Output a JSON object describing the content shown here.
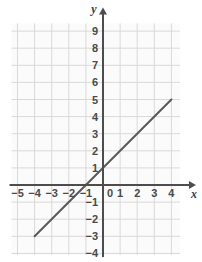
{
  "chart_data": {
    "type": "line",
    "title": "",
    "xlabel": "x",
    "ylabel": "y",
    "xlim": [
      -5.5,
      5
    ],
    "ylim": [
      -4.5,
      9.5
    ],
    "xticks": [
      -5,
      -4,
      -3,
      -2,
      -1,
      0,
      1,
      2,
      3,
      4
    ],
    "yticks": [
      -4,
      -3,
      -2,
      -1,
      0,
      1,
      2,
      3,
      4,
      5,
      6,
      7,
      8,
      9
    ],
    "xtick_labels": [
      "-5",
      "-4",
      "-3",
      "-2",
      "-1",
      "0",
      "1",
      "2",
      "3",
      "4"
    ],
    "ytick_labels": [
      "9",
      "8",
      "7",
      "6",
      "5",
      "4",
      "3",
      "2",
      "1",
      "0",
      "-1",
      "-2",
      "-3",
      "-4"
    ],
    "grid": true,
    "legend": "none",
    "series": [
      {
        "name": "line",
        "equation": "y = x + 1",
        "slope": 1,
        "intercept": 1,
        "x": [
          -4,
          4
        ],
        "values": [
          -3,
          5
        ],
        "points": [
          [
            -4,
            -3
          ],
          [
            0,
            1
          ],
          [
            4,
            5
          ]
        ],
        "x_intercept": -1,
        "y_intercept": 1,
        "color": "#595959"
      }
    ],
    "colors": {
      "line": "#595959",
      "axis": "#4d4d4d",
      "grid": "#d9d9d9",
      "grid_background": "#fbfbfb",
      "tick_text": "#4a4a4a",
      "background": "#ffffff"
    }
  },
  "axis_labels": {
    "x": "x",
    "y": "y"
  }
}
